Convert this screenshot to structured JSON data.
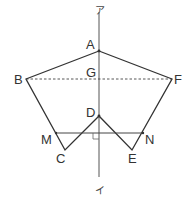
{
  "diagram": {
    "type": "geometry",
    "colors": {
      "stroke": "#333333",
      "axis": "#555555",
      "background": "#ffffff"
    },
    "axis": {
      "top_label": "ア",
      "bottom_label": "イ",
      "x": 99,
      "y_top": 12,
      "y_bottom": 177
    },
    "points": {
      "A": {
        "label": "A",
        "x": 99,
        "y": 51
      },
      "B": {
        "label": "B",
        "x": 26,
        "y": 79
      },
      "C": {
        "label": "C",
        "x": 65,
        "y": 150
      },
      "D": {
        "label": "D",
        "x": 99,
        "y": 116
      },
      "E": {
        "label": "E",
        "x": 132,
        "y": 150
      },
      "F": {
        "label": "F",
        "x": 172,
        "y": 79
      },
      "G": {
        "label": "G",
        "x": 99,
        "y": 79
      },
      "M": {
        "label": "M",
        "x": 56,
        "y": 133
      },
      "N": {
        "label": "N",
        "x": 143,
        "y": 133
      }
    },
    "segments": {
      "solid": [
        "A-B",
        "B-C",
        "C-D",
        "D-E",
        "E-F",
        "F-A",
        "M-N"
      ],
      "dashed": [
        "B-F"
      ]
    },
    "right_angle_at": "MN ⟂ axis"
  }
}
